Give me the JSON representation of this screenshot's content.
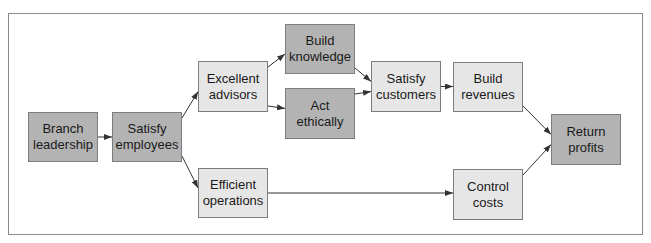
{
  "diagram": {
    "type": "flowchart",
    "colors": {
      "dark_fill": "#b3b3b3",
      "light_fill": "#e6e6e6",
      "border": "#7d7d7d",
      "arrow": "#333333"
    },
    "nodes": [
      {
        "id": "branch_leadership",
        "label": "Branch\nleadership",
        "style": "dark",
        "x": 28,
        "y": 112,
        "w": 70,
        "h": 50
      },
      {
        "id": "satisfy_employees",
        "label": "Satisfy\nemployees",
        "style": "dark",
        "x": 112,
        "y": 112,
        "w": 70,
        "h": 50
      },
      {
        "id": "excellent_advisors",
        "label": "Excellent\nadvisors",
        "style": "light",
        "x": 198,
        "y": 61,
        "w": 70,
        "h": 51
      },
      {
        "id": "build_knowledge",
        "label": "Build\nknowledge",
        "style": "dark",
        "x": 285,
        "y": 24,
        "w": 70,
        "h": 50
      },
      {
        "id": "act_ethically",
        "label": "Act\nethically",
        "style": "dark",
        "x": 285,
        "y": 88,
        "w": 70,
        "h": 51
      },
      {
        "id": "satisfy_customers",
        "label": "Satisfy\ncustomers",
        "style": "light",
        "x": 371,
        "y": 61,
        "w": 70,
        "h": 51
      },
      {
        "id": "build_revenues",
        "label": "Build\nrevenues",
        "style": "light",
        "x": 453,
        "y": 62,
        "w": 70,
        "h": 50
      },
      {
        "id": "return_profits",
        "label": "Return\nprofits",
        "style": "dark",
        "x": 551,
        "y": 114,
        "w": 70,
        "h": 51
      },
      {
        "id": "efficient_operations",
        "label": "Efficient\noperations",
        "style": "light",
        "x": 198,
        "y": 168,
        "w": 70,
        "h": 50
      },
      {
        "id": "control_costs",
        "label": "Control\ncosts",
        "style": "light",
        "x": 453,
        "y": 169,
        "w": 70,
        "h": 51
      }
    ],
    "edges": [
      {
        "from": "branch_leadership",
        "to": "satisfy_employees"
      },
      {
        "from": "satisfy_employees",
        "to": "excellent_advisors"
      },
      {
        "from": "satisfy_employees",
        "to": "efficient_operations"
      },
      {
        "from": "excellent_advisors",
        "to": "build_knowledge"
      },
      {
        "from": "excellent_advisors",
        "to": "act_ethically"
      },
      {
        "from": "build_knowledge",
        "to": "satisfy_customers"
      },
      {
        "from": "act_ethically",
        "to": "satisfy_customers"
      },
      {
        "from": "satisfy_customers",
        "to": "build_revenues"
      },
      {
        "from": "build_revenues",
        "to": "return_profits"
      },
      {
        "from": "efficient_operations",
        "to": "control_costs"
      },
      {
        "from": "control_costs",
        "to": "return_profits"
      }
    ]
  }
}
